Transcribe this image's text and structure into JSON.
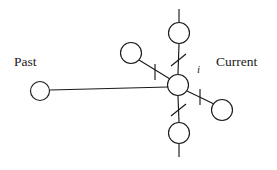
{
  "figure": {
    "type": "node-link-diagram",
    "background_color": "#ffffff",
    "stroke_color": "#1a1a1a",
    "width": 277,
    "height": 170
  },
  "labels": {
    "past": "Past",
    "current": "Current",
    "center_node": "i"
  },
  "label_positions": {
    "past": {
      "x": 14,
      "y": 55
    },
    "current": {
      "x": 216,
      "y": 55
    },
    "center_node": {
      "x": 197,
      "y": 64
    }
  },
  "nodes": [
    {
      "id": "past",
      "name": "past-node",
      "cx": 40,
      "cy": 91,
      "r": 9.5,
      "label": ""
    },
    {
      "id": "center",
      "name": "center-node",
      "cx": 178,
      "cy": 85,
      "r": 10.5,
      "label": "i"
    },
    {
      "id": "upper_left",
      "name": "upper-left-node",
      "cx": 131,
      "cy": 53,
      "r": 10.5,
      "label": ""
    },
    {
      "id": "top",
      "name": "top-node",
      "cx": 179,
      "cy": 33,
      "r": 10.5,
      "label": ""
    },
    {
      "id": "bottom",
      "name": "bottom-node",
      "cx": 179,
      "cy": 133,
      "r": 10.5,
      "label": ""
    },
    {
      "id": "lower_right",
      "name": "lower-right-node",
      "cx": 222,
      "cy": 110,
      "r": 10.5,
      "label": ""
    }
  ],
  "edges": [
    {
      "id": "e_past_center",
      "from": "past",
      "to": "center",
      "x1": 50,
      "y1": 90,
      "x2": 168,
      "y2": 87,
      "ticked": false
    },
    {
      "id": "e_upperleft_center",
      "from": "upper_left",
      "to": "center",
      "x1": 139,
      "y1": 60,
      "x2": 170,
      "y2": 79,
      "ticked": true
    },
    {
      "id": "e_top_center",
      "from": "top",
      "to": "center",
      "x1": 179,
      "y1": 44,
      "x2": 178,
      "y2": 74,
      "ticked": true
    },
    {
      "id": "e_center_bottom",
      "from": "center",
      "to": "bottom",
      "x1": 178,
      "y1": 96,
      "x2": 179,
      "y2": 122,
      "ticked": true
    },
    {
      "id": "e_center_lowerright",
      "from": "center",
      "to": "lower_right",
      "x1": 187,
      "y1": 91,
      "x2": 214,
      "y2": 104,
      "ticked": true
    }
  ],
  "stubs": [
    {
      "id": "stub_top",
      "name": "top-stub-line",
      "x1": 179,
      "y1": 9,
      "x2": 179,
      "y2": 22
    },
    {
      "id": "stub_bottom",
      "name": "bottom-stub-line",
      "x1": 179,
      "y1": 144,
      "x2": 179,
      "y2": 157
    }
  ],
  "ticks": [
    {
      "id": "tick_upperleft",
      "name": "tick-upper-left-edge",
      "orientation": "vertical",
      "x1": 155,
      "y1": 64,
      "x2": 155,
      "y2": 80
    },
    {
      "id": "tick_top",
      "name": "tick-top-edge",
      "orientation": "diagonal",
      "x1": 171,
      "y1": 66,
      "x2": 186,
      "y2": 54
    },
    {
      "id": "tick_bottom",
      "name": "tick-bottom-edge",
      "orientation": "diagonal",
      "x1": 171,
      "y1": 116,
      "x2": 186,
      "y2": 104
    },
    {
      "id": "tick_lowerright",
      "name": "tick-lower-right-edge",
      "orientation": "vertical",
      "x1": 200,
      "y1": 89,
      "x2": 200,
      "y2": 105
    }
  ]
}
